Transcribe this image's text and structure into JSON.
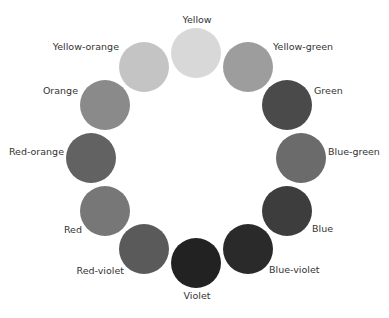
{
  "diagram": {
    "center": [
      196,
      158
    ],
    "ring_radius": 105,
    "swatch_radius": 25,
    "segments": [
      {
        "name": "Yellow",
        "color": "#d8d8d8",
        "cx": 196,
        "cy": 53,
        "lx": 197,
        "ly": 20,
        "align": "center"
      },
      {
        "name": "Yellow-green",
        "color": "#9d9d9d",
        "cx": 248,
        "cy": 67,
        "lx": 273,
        "ly": 47,
        "align": "left"
      },
      {
        "name": "Green",
        "color": "#4a4a4a",
        "cx": 287,
        "cy": 105,
        "lx": 314,
        "ly": 91,
        "align": "left"
      },
      {
        "name": "Blue-green",
        "color": "#6b6b6b",
        "cx": 301,
        "cy": 158,
        "lx": 328,
        "ly": 152,
        "align": "left"
      },
      {
        "name": "Blue",
        "color": "#3d3d3d",
        "cx": 287,
        "cy": 211,
        "lx": 312,
        "ly": 229,
        "align": "left"
      },
      {
        "name": "Blue-violet",
        "color": "#2a2a2a",
        "cx": 248,
        "cy": 249,
        "lx": 269,
        "ly": 270,
        "align": "left"
      },
      {
        "name": "Violet",
        "color": "#222222",
        "cx": 196,
        "cy": 263,
        "lx": 197,
        "ly": 296,
        "align": "center"
      },
      {
        "name": "Red-violet",
        "color": "#5a5a5a",
        "cx": 144,
        "cy": 249,
        "lx": 124,
        "ly": 271,
        "align": "right"
      },
      {
        "name": "Red",
        "color": "#777777",
        "cx": 105,
        "cy": 211,
        "lx": 82,
        "ly": 230,
        "align": "right"
      },
      {
        "name": "Red-orange",
        "color": "#626262",
        "cx": 91,
        "cy": 158,
        "lx": 64,
        "ly": 152,
        "align": "right"
      },
      {
        "name": "Orange",
        "color": "#8a8a8a",
        "cx": 105,
        "cy": 105,
        "lx": 78,
        "ly": 91,
        "align": "right"
      },
      {
        "name": "Yellow-orange",
        "color": "#c4c4c4",
        "cx": 144,
        "cy": 67,
        "lx": 119,
        "ly": 47,
        "align": "right"
      }
    ]
  }
}
